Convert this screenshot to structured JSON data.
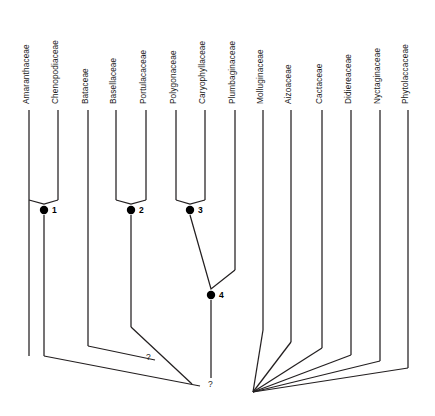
{
  "figure": {
    "type": "cladogram",
    "title": "",
    "background_color": "#ffffff",
    "line_color": "#231f20",
    "node_color": "#000000",
    "text_color": "#1a1a1a"
  },
  "taxa": [
    {
      "id": "amaranthaceae",
      "label": "Amaranthaceae",
      "x": 29,
      "tip_y": 110,
      "stem_bottom_y": 356
    },
    {
      "id": "chenopodiaceae",
      "label": "Chenopodiaceae",
      "x": 58,
      "tip_y": 110,
      "stem_bottom_y": 200
    },
    {
      "id": "bataceae",
      "label": "Bataceae",
      "x": 88,
      "tip_y": 110,
      "stem_bottom_y": 346
    },
    {
      "id": "basellaceae",
      "label": "Basellaceae",
      "x": 116,
      "tip_y": 110,
      "stem_bottom_y": 200
    },
    {
      "id": "portulacaceae",
      "label": "Portulacaceae",
      "x": 146,
      "tip_y": 110,
      "stem_bottom_y": 200
    },
    {
      "id": "polygonaceae",
      "label": "Polygonaceae",
      "x": 176,
      "tip_y": 110,
      "stem_bottom_y": 200
    },
    {
      "id": "caryophyllaceae",
      "label": "Caryophyllaceae",
      "x": 205,
      "tip_y": 110,
      "stem_bottom_y": 200
    },
    {
      "id": "plumbaginaceae",
      "label": "Plumbaginaceae",
      "x": 235,
      "tip_y": 110,
      "stem_bottom_y": 270
    },
    {
      "id": "molluginaceae",
      "label": "Molluginaceae",
      "x": 263,
      "tip_y": 110,
      "stem_bottom_y": 330
    },
    {
      "id": "aizoaceae",
      "label": "Aizoaceae",
      "x": 291,
      "tip_y": 110,
      "stem_bottom_y": 342
    },
    {
      "id": "cactaceae",
      "label": "Cactaceae",
      "x": 322,
      "tip_y": 110,
      "stem_bottom_y": 348
    },
    {
      "id": "didiereaceae",
      "label": "Didiereaceae",
      "x": 351,
      "tip_y": 110,
      "stem_bottom_y": 355
    },
    {
      "id": "nyctaginaceae",
      "label": "Nyctaginaceae",
      "x": 380,
      "tip_y": 110,
      "stem_bottom_y": 361
    },
    {
      "id": "phytolaccaceae",
      "label": "Phytolaccaceae",
      "x": 408,
      "tip_y": 110,
      "stem_bottom_y": 368
    }
  ],
  "label_baseline_y": 104,
  "nodes": [
    {
      "id": "node-1",
      "number": "1",
      "x": 44,
      "y": 210,
      "label_x": 52,
      "label_y": 213
    },
    {
      "id": "node-2",
      "number": "2",
      "x": 131,
      "y": 210,
      "label_x": 139,
      "label_y": 213
    },
    {
      "id": "node-3",
      "number": "3",
      "x": 190,
      "y": 210,
      "label_x": 198,
      "label_y": 213
    },
    {
      "id": "node-4",
      "number": "4",
      "x": 211,
      "y": 295,
      "label_x": 219,
      "label_y": 298
    }
  ],
  "node_dot_radius": 4.2,
  "clade_joins": [
    {
      "id": "join-node-1",
      "left_x": 29,
      "right_x": 58,
      "apex_x": 44,
      "top_y": 200,
      "apex_y": 204
    },
    {
      "id": "join-node-2",
      "left_x": 116,
      "right_x": 146,
      "apex_x": 131,
      "top_y": 200,
      "apex_y": 204
    },
    {
      "id": "join-node-3",
      "left_x": 176,
      "right_x": 205,
      "apex_x": 190,
      "top_y": 200,
      "apex_y": 204
    },
    {
      "id": "join-node-4",
      "left_x": 190,
      "right_x": 235,
      "apex_x": 211,
      "top_y": 270,
      "apex_y": 289,
      "left_top_y": 215
    }
  ],
  "stems": [
    {
      "id": "stem-node-1",
      "x": 44,
      "from_y": 215,
      "to_y": 356
    },
    {
      "id": "stem-node-2",
      "x": 131,
      "from_y": 215,
      "to_y": 327
    },
    {
      "id": "stem-node-4",
      "x": 211,
      "from_y": 300,
      "to_y": 378
    }
  ],
  "basal_branches": [
    {
      "id": "basal-amaranth-clade",
      "points": "44,356 200,386"
    },
    {
      "id": "basal-bataceae",
      "points": "88,346 155,360"
    },
    {
      "id": "basal-node-2-clade",
      "points": "131,327 192,384"
    }
  ],
  "right_fan": {
    "convergence_x": 253,
    "convergence_y": 392,
    "branches": [
      {
        "id": "fan-molluginaceae",
        "from_x": 263,
        "from_y": 330
      },
      {
        "id": "fan-aizoaceae",
        "from_x": 291,
        "from_y": 342
      },
      {
        "id": "fan-cactaceae",
        "from_x": 322,
        "from_y": 348
      },
      {
        "id": "fan-didiereaceae",
        "from_x": 351,
        "from_y": 355
      },
      {
        "id": "fan-nyctaginaceae",
        "from_x": 380,
        "from_y": 361
      },
      {
        "id": "fan-phytolaccaceae",
        "from_x": 408,
        "from_y": 368
      }
    ]
  },
  "unknown_marks": [
    {
      "id": "unknown-left",
      "symbol": "?",
      "x": 146,
      "y": 360
    },
    {
      "id": "unknown-right",
      "symbol": "?",
      "x": 208,
      "y": 387
    }
  ]
}
